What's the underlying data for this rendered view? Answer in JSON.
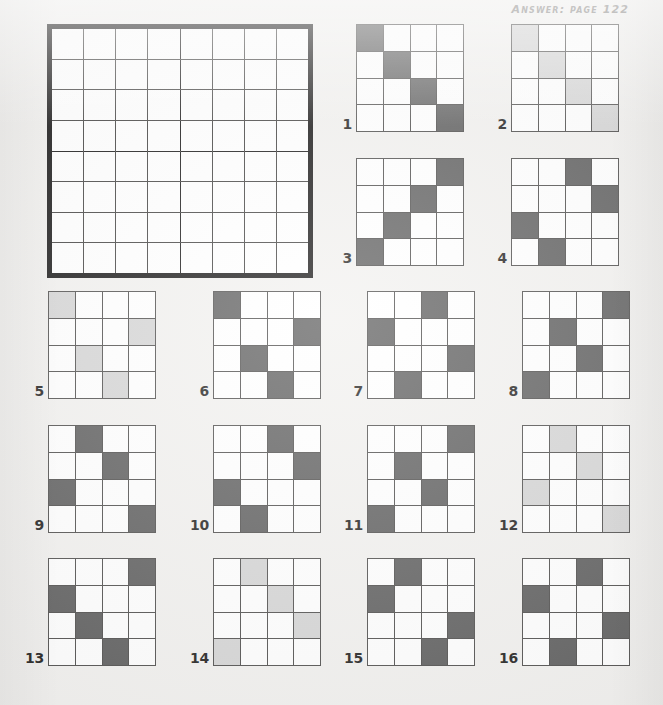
{
  "page": {
    "background_color": "#f2f1ef",
    "answer_reference": "Answer: page 122",
    "colors": {
      "dark_fill": "#5a5a5a",
      "light_fill": "#d4d4d4",
      "empty_cell": "#ffffff",
      "grid_line": "#4a4948",
      "main_border": "#111010",
      "number_text": "#1b1a19",
      "header_text": "#7c7a78"
    }
  },
  "main_grid": {
    "label": "main-answer-grid",
    "rows": 8,
    "cols": 8,
    "block_rows": 4,
    "block_cols": 4,
    "cells": [
      [
        "",
        "",
        "",
        "",
        "",
        "",
        "",
        ""
      ],
      [
        "",
        "",
        "",
        "",
        "",
        "",
        "",
        ""
      ],
      [
        "",
        "",
        "",
        "",
        "",
        "",
        "",
        ""
      ],
      [
        "",
        "",
        "",
        "",
        "",
        "",
        "",
        ""
      ],
      [
        "",
        "",
        "",
        "",
        "",
        "",
        "",
        ""
      ],
      [
        "",
        "",
        "",
        "",
        "",
        "",
        "",
        ""
      ],
      [
        "",
        "",
        "",
        "",
        "",
        "",
        "",
        ""
      ],
      [
        "",
        "",
        "",
        "",
        "",
        "",
        "",
        ""
      ]
    ]
  },
  "puzzles": [
    {
      "number": "1",
      "shade": "dark",
      "cells": [
        [
          "dark",
          "",
          "",
          ""
        ],
        [
          "",
          "dark",
          "",
          ""
        ],
        [
          "",
          "",
          "dark",
          ""
        ],
        [
          "",
          "",
          "",
          "dark"
        ]
      ]
    },
    {
      "number": "2",
      "shade": "light",
      "cells": [
        [
          "light",
          "",
          "",
          ""
        ],
        [
          "",
          "light",
          "",
          ""
        ],
        [
          "",
          "",
          "light",
          ""
        ],
        [
          "",
          "",
          "",
          "light"
        ]
      ]
    },
    {
      "number": "3",
      "shade": "dark",
      "cells": [
        [
          "",
          "",
          "",
          "dark"
        ],
        [
          "",
          "",
          "dark",
          ""
        ],
        [
          "",
          "dark",
          "",
          ""
        ],
        [
          "dark",
          "",
          "",
          ""
        ]
      ]
    },
    {
      "number": "4",
      "shade": "dark",
      "cells": [
        [
          "",
          "",
          "dark",
          ""
        ],
        [
          "",
          "",
          "",
          "dark"
        ],
        [
          "dark",
          "",
          "",
          ""
        ],
        [
          "",
          "dark",
          "",
          ""
        ]
      ]
    },
    {
      "number": "5",
      "shade": "light",
      "cells": [
        [
          "light",
          "",
          "",
          ""
        ],
        [
          "",
          "",
          "",
          "light"
        ],
        [
          "",
          "light",
          "",
          ""
        ],
        [
          "",
          "",
          "light",
          ""
        ]
      ]
    },
    {
      "number": "6",
      "shade": "dark",
      "cells": [
        [
          "dark",
          "",
          "",
          ""
        ],
        [
          "",
          "",
          "",
          "dark"
        ],
        [
          "",
          "dark",
          "",
          ""
        ],
        [
          "",
          "",
          "dark",
          ""
        ]
      ]
    },
    {
      "number": "7",
      "shade": "dark",
      "cells": [
        [
          "",
          "",
          "dark",
          ""
        ],
        [
          "dark",
          "",
          "",
          ""
        ],
        [
          "",
          "",
          "",
          "dark"
        ],
        [
          "",
          "dark",
          "",
          ""
        ]
      ]
    },
    {
      "number": "8",
      "shade": "dark",
      "cells": [
        [
          "",
          "",
          "",
          "dark"
        ],
        [
          "",
          "dark",
          "",
          ""
        ],
        [
          "",
          "",
          "dark",
          ""
        ],
        [
          "dark",
          "",
          "",
          ""
        ]
      ]
    },
    {
      "number": "9",
      "shade": "dark",
      "cells": [
        [
          "",
          "dark",
          "",
          ""
        ],
        [
          "",
          "",
          "dark",
          ""
        ],
        [
          "dark",
          "",
          "",
          ""
        ],
        [
          "",
          "",
          "",
          "dark"
        ]
      ]
    },
    {
      "number": "10",
      "shade": "dark",
      "cells": [
        [
          "",
          "",
          "dark",
          ""
        ],
        [
          "",
          "",
          "",
          "dark"
        ],
        [
          "dark",
          "",
          "",
          ""
        ],
        [
          "",
          "dark",
          "",
          ""
        ]
      ]
    },
    {
      "number": "11",
      "shade": "dark",
      "cells": [
        [
          "",
          "",
          "",
          "dark"
        ],
        [
          "",
          "dark",
          "",
          ""
        ],
        [
          "",
          "",
          "dark",
          ""
        ],
        [
          "dark",
          "",
          "",
          ""
        ]
      ]
    },
    {
      "number": "12",
      "shade": "light",
      "cells": [
        [
          "",
          "light",
          "",
          ""
        ],
        [
          "",
          "",
          "light",
          ""
        ],
        [
          "light",
          "",
          "",
          ""
        ],
        [
          "",
          "",
          "",
          "light"
        ]
      ]
    },
    {
      "number": "13",
      "shade": "dark",
      "cells": [
        [
          "",
          "",
          "",
          "dark"
        ],
        [
          "dark",
          "",
          "",
          ""
        ],
        [
          "",
          "dark",
          "",
          ""
        ],
        [
          "",
          "",
          "dark",
          ""
        ]
      ]
    },
    {
      "number": "14",
      "shade": "light",
      "cells": [
        [
          "",
          "light",
          "",
          ""
        ],
        [
          "",
          "",
          "light",
          ""
        ],
        [
          "",
          "",
          "",
          "light"
        ],
        [
          "light",
          "",
          "",
          ""
        ]
      ]
    },
    {
      "number": "15",
      "shade": "dark",
      "cells": [
        [
          "",
          "dark",
          "",
          ""
        ],
        [
          "dark",
          "",
          "",
          ""
        ],
        [
          "",
          "",
          "",
          "dark"
        ],
        [
          "",
          "",
          "dark",
          ""
        ]
      ]
    },
    {
      "number": "16",
      "shade": "dark",
      "cells": [
        [
          "",
          "",
          "dark",
          ""
        ],
        [
          "dark",
          "",
          "",
          ""
        ],
        [
          "",
          "",
          "",
          "dark"
        ],
        [
          "",
          "dark",
          "",
          ""
        ]
      ]
    }
  ],
  "layout": {
    "puzzle_positions": [
      {
        "left": 330,
        "top": 24,
        "size": 106
      },
      {
        "left": 485,
        "top": 24,
        "size": 106
      },
      {
        "left": 330,
        "top": 158,
        "size": 106
      },
      {
        "left": 485,
        "top": 158,
        "size": 106
      },
      {
        "left": 22,
        "top": 291,
        "size": 106
      },
      {
        "left": 187,
        "top": 291,
        "size": 106
      },
      {
        "left": 341,
        "top": 291,
        "size": 106
      },
      {
        "left": 496,
        "top": 291,
        "size": 106
      },
      {
        "left": 22,
        "top": 425,
        "size": 106
      },
      {
        "left": 187,
        "top": 425,
        "size": 106
      },
      {
        "left": 341,
        "top": 425,
        "size": 106
      },
      {
        "left": 496,
        "top": 425,
        "size": 106
      },
      {
        "left": 22,
        "top": 558,
        "size": 106
      },
      {
        "left": 187,
        "top": 558,
        "size": 106
      },
      {
        "left": 341,
        "top": 558,
        "size": 106
      },
      {
        "left": 496,
        "top": 558,
        "size": 106
      }
    ]
  }
}
